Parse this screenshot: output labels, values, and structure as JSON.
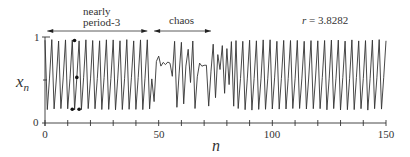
{
  "chart_data": {
    "type": "line",
    "title": "",
    "xlabel": "n",
    "ylabel": "x_n",
    "xlim": [
      0,
      150
    ],
    "ylim": [
      0,
      1
    ],
    "xticks": [
      0,
      50,
      100,
      150
    ],
    "xticks_minor_step": 10,
    "yticks": [
      0,
      1
    ],
    "ytick_minor": [
      0.5
    ],
    "grid": false,
    "annotations": [
      {
        "text": "nearly\nperiod-3",
        "arrow_from": 1,
        "arrow_to": 45
      },
      {
        "text": "chaos",
        "arrow_from": 48,
        "arrow_to": 73
      },
      {
        "text": "r = 3.8282"
      }
    ],
    "marked_points": [
      {
        "n": 12,
        "x": 0.16
      },
      {
        "n": 13,
        "x": 0.96
      },
      {
        "n": 14,
        "x": 0.53
      },
      {
        "n": 15,
        "x": 0.16
      }
    ],
    "series": [
      {
        "name": "x_n (logistic map, r = 3.8282)",
        "description": "Intermittency: nearly period-3 oscillation (values ~0.96, ~0.16, ~0.5) for n≈0–48 and n≈85–150, with a chaotic burst around n≈48–84.",
        "segments": [
          {
            "n_range": [
              0,
              48
            ],
            "behavior": "nearly period-3",
            "cycle": [
              0.96,
              0.16,
              0.52
            ]
          },
          {
            "n_range": [
              48,
              84
            ],
            "behavior": "chaos"
          },
          {
            "n_range": [
              84,
              150
            ],
            "behavior": "nearly period-3",
            "cycle": [
              0.96,
              0.16,
              0.52
            ]
          }
        ]
      }
    ]
  },
  "labels": {
    "annot1_line1": "nearly",
    "annot1_line2": "period-3",
    "annot2": "chaos",
    "annot3": "r = 3.8282",
    "ylabel": "x",
    "ylabel_sub": "n",
    "xlabel": "n",
    "ytick_1": "1",
    "ytick_0": "0",
    "xtick_0": "0",
    "xtick_50": "50",
    "xtick_100": "100",
    "xtick_150": "150"
  }
}
